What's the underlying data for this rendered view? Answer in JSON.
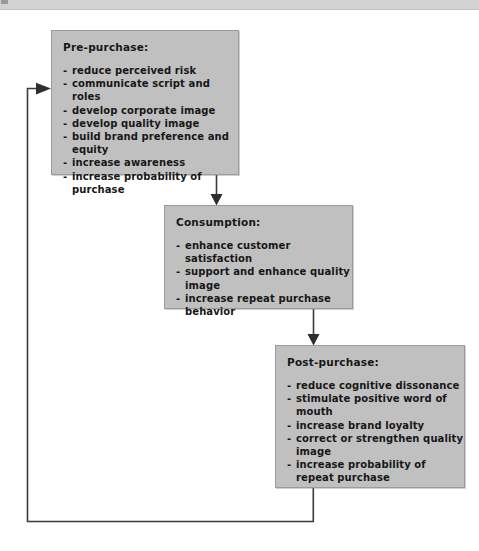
{
  "top_bar": {
    "icon": "page-edge-marker"
  },
  "diagram": {
    "type": "flow-diagram",
    "title_visible": false,
    "box_fill_color": "#c0c0c0",
    "box_border_color": "#9b9b9b",
    "line_color": "#3a3a3a",
    "boxes": [
      {
        "id": "pre-purchase",
        "title": "Pre-purchase:",
        "items": [
          "reduce perceived risk",
          "communicate script and roles",
          "develop corporate image",
          "develop quality image",
          "build brand preference and equity",
          "increase awareness",
          "increase probability of purchase"
        ]
      },
      {
        "id": "consumption",
        "title": "Consumption:",
        "items": [
          "enhance customer satisfaction",
          "support and enhance quality image",
          "increase repeat purchase behavior"
        ]
      },
      {
        "id": "post-purchase",
        "title": "Post-purchase:",
        "items": [
          "reduce cognitive dissonance",
          "stimulate positive word of mouth",
          "increase brand loyalty",
          "correct or strengthen quality image",
          "increase probability of repeat purchase"
        ]
      }
    ],
    "connectors": [
      {
        "id": "pre-to-consumption",
        "from": "pre-purchase",
        "to": "consumption",
        "direction": "down",
        "arrowhead": true
      },
      {
        "id": "consumption-to-post",
        "from": "consumption",
        "to": "post-purchase",
        "direction": "down",
        "arrowhead": true
      },
      {
        "id": "post-to-pre-feedback",
        "from": "post-purchase",
        "to": "pre-purchase",
        "direction": "loop-left-up",
        "arrowhead": true
      }
    ],
    "bullet_marker": "-"
  }
}
